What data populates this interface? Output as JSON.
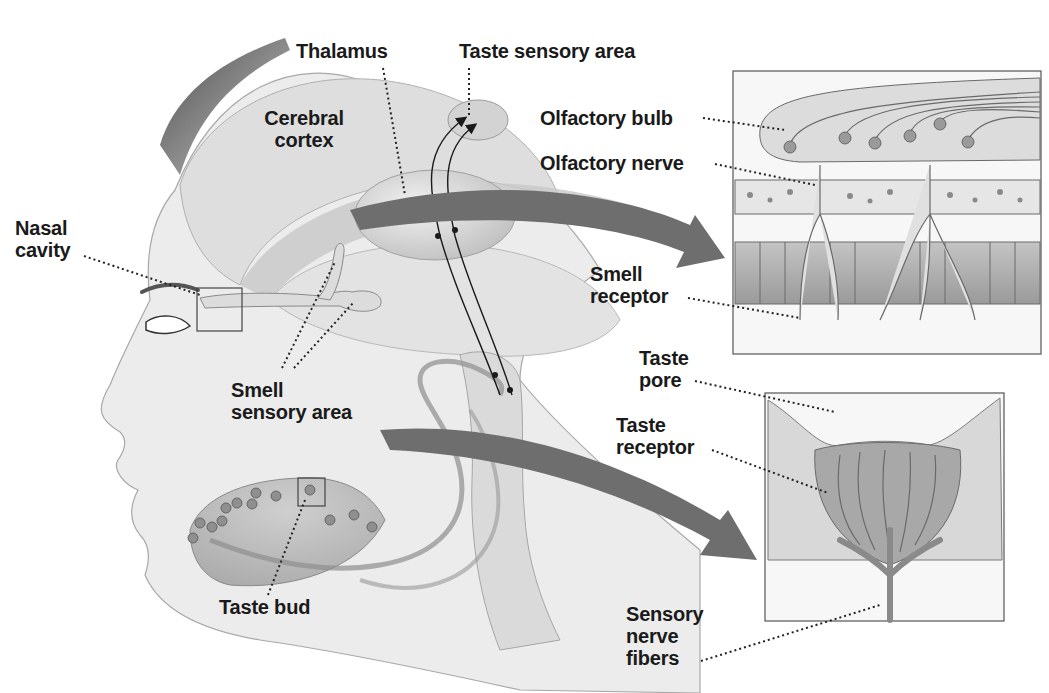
{
  "figure": {
    "background": "#ffffff",
    "palette": {
      "ink": "#1a1a1a",
      "skin": "#e6e6e6",
      "skin_shade": "#c9c9c9",
      "brain": "#d6d6d6",
      "arrow": "#6e6e6e",
      "inset_border": "#555555"
    }
  },
  "labels": {
    "thalamus": "Thalamus",
    "taste_sensory_area": "Taste sensory area",
    "cerebral_cortex": "Cerebral\ncortex",
    "nasal_cavity": "Nasal\ncavity",
    "smell_sensory_area": "Smell\nsensory area",
    "taste_bud": "Taste bud",
    "olfactory_bulb": "Olfactory bulb",
    "olfactory_nerve": "Olfactory nerve",
    "smell_receptor": "Smell\nreceptor",
    "taste_pore": "Taste\npore",
    "taste_receptor": "Taste\nreceptor",
    "sensory_nerve_fibers": "Sensory\nnerve\nfibers"
  },
  "insets": [
    {
      "name": "olfactory-inset",
      "shows": [
        "Olfactory bulb",
        "Olfactory nerve",
        "Smell receptor"
      ]
    },
    {
      "name": "taste-bud-inset",
      "shows": [
        "Taste pore",
        "Taste receptor",
        "Sensory nerve fibers"
      ]
    }
  ]
}
